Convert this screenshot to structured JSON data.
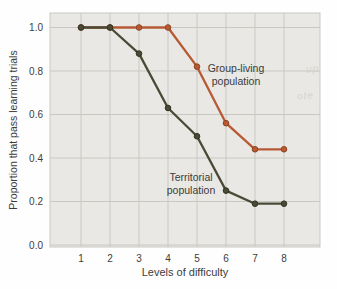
{
  "chart_data": {
    "type": "line",
    "title": "",
    "xlabel": "Levels of difficulty",
    "ylabel": "Proportion that pass learning trials",
    "x": [
      1,
      2,
      3,
      4,
      5,
      6,
      7,
      8
    ],
    "xticklabels": [
      "1",
      "2",
      "3",
      "4",
      "5",
      "6",
      "7",
      "8"
    ],
    "ylim": [
      0.0,
      1.0
    ],
    "yticks": [
      0.0,
      0.2,
      0.4,
      0.6,
      0.8,
      1.0
    ],
    "yticklabels": [
      "0.0",
      "0.2",
      "0.4",
      "0.6",
      "0.8",
      "1.0"
    ],
    "grid": true,
    "legend_position": "inline-annotations",
    "series": [
      {
        "name": "Group-living population",
        "color": "#b75a34",
        "marker_edge": "#8e4323",
        "values": [
          1.0,
          1.0,
          1.0,
          1.0,
          0.82,
          0.56,
          0.44,
          0.44
        ]
      },
      {
        "name": "Territorial population",
        "color": "#4b4a37",
        "marker_edge": "#32321f",
        "values": [
          1.0,
          1.0,
          0.88,
          0.63,
          0.5,
          0.25,
          0.19,
          0.19
        ]
      }
    ],
    "annotations": [
      {
        "text": "Group-living\npopulation",
        "x": 236,
        "y": 74
      },
      {
        "text": "Territorial\npopulation",
        "x": 191,
        "y": 183
      }
    ],
    "colors": {
      "plot_bg": "#e9e8e4",
      "grid": "#c8c8c3",
      "text": "#3c3c3c"
    }
  },
  "artifacts": {
    "bleed_text_1": "up",
    "bleed_text_2": "ote"
  }
}
